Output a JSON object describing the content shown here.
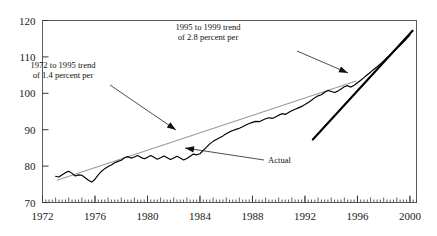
{
  "chart_data": {
    "type": "line",
    "title": "",
    "subtitle": "",
    "xlabel": "",
    "ylabel": "",
    "xlim": [
      1972,
      2000.5
    ],
    "ylim": [
      70,
      120
    ],
    "grid": false,
    "legend_position": "none",
    "y_ticks": [
      70,
      80,
      90,
      100,
      110,
      120
    ],
    "x_ticks": [
      1972,
      1976,
      1980,
      1984,
      1988,
      1992,
      1996,
      2000
    ],
    "x_minor_tick_interval": 0.25,
    "colors": {
      "actual_series": "#000000",
      "trend_1972_1995": "#9a9a9a",
      "trend_1995_1999": "#000000",
      "frame": "#5b5b5b",
      "text": "#111111"
    },
    "series": [
      {
        "name": "Actual",
        "style": "solid-black",
        "x": [
          1973.0,
          1973.25,
          1973.5,
          1973.75,
          1974.0,
          1974.25,
          1974.5,
          1974.75,
          1975.0,
          1975.25,
          1975.5,
          1975.75,
          1976.0,
          1976.25,
          1976.5,
          1976.75,
          1977.0,
          1977.25,
          1977.5,
          1977.75,
          1978.0,
          1978.25,
          1978.5,
          1978.75,
          1979.0,
          1979.25,
          1979.5,
          1979.75,
          1980.0,
          1980.25,
          1980.5,
          1980.75,
          1981.0,
          1981.25,
          1981.5,
          1981.75,
          1982.0,
          1982.25,
          1982.5,
          1982.75,
          1983.0,
          1983.25,
          1983.5,
          1983.75,
          1984.0,
          1984.25,
          1984.5,
          1984.75,
          1985.0,
          1985.25,
          1985.5,
          1985.75,
          1986.0,
          1986.25,
          1986.5,
          1986.75,
          1987.0,
          1987.25,
          1987.5,
          1987.75,
          1988.0,
          1988.25,
          1988.5,
          1988.75,
          1989.0,
          1989.25,
          1989.5,
          1989.75,
          1990.0,
          1990.25,
          1990.5,
          1990.75,
          1991.0,
          1991.25,
          1991.5,
          1991.75,
          1992.0,
          1992.25,
          1992.5,
          1992.75,
          1993.0,
          1993.25,
          1993.5,
          1993.75,
          1994.0,
          1994.25,
          1994.5,
          1994.75,
          1995.0,
          1995.25,
          1995.5,
          1995.75,
          1996.0,
          1996.25,
          1996.5,
          1996.75,
          1997.0,
          1997.25,
          1997.5,
          1997.75,
          1998.0,
          1998.25,
          1998.5,
          1998.75,
          1999.0,
          1999.25,
          1999.5,
          1999.75,
          2000.0
        ],
        "y": [
          77.2,
          77.0,
          77.6,
          78.2,
          78.6,
          78.0,
          77.3,
          77.6,
          77.5,
          76.8,
          76.1,
          75.6,
          76.4,
          77.6,
          78.6,
          79.3,
          79.9,
          80.3,
          80.9,
          81.3,
          81.6,
          82.3,
          82.6,
          82.2,
          82.5,
          82.9,
          82.4,
          82.0,
          82.4,
          82.9,
          82.4,
          81.9,
          82.3,
          82.8,
          82.3,
          81.8,
          82.2,
          82.7,
          82.2,
          81.7,
          82.1,
          82.7,
          83.3,
          83.1,
          83.4,
          84.3,
          85.2,
          86.1,
          86.8,
          87.3,
          87.8,
          88.3,
          88.9,
          89.4,
          89.8,
          90.1,
          90.4,
          90.8,
          91.3,
          91.7,
          92.0,
          92.3,
          92.2,
          92.6,
          93.0,
          93.3,
          93.1,
          93.5,
          94.0,
          94.4,
          94.2,
          94.7,
          95.2,
          95.6,
          96.0,
          96.4,
          96.9,
          97.5,
          98.1,
          98.8,
          99.3,
          99.6,
          100.3,
          100.8,
          100.5,
          100.2,
          100.6,
          101.2,
          101.8,
          102.1,
          101.7,
          102.2,
          102.9,
          103.6,
          104.3,
          105.1,
          105.8,
          106.6,
          107.3,
          108.1,
          108.9,
          109.8,
          110.6,
          111.5,
          112.3,
          113.2,
          114.1,
          115.0,
          116.0
        ]
      }
    ],
    "trend_lines": [
      {
        "name": "1972 to 1995 trend of 1.4 percent per year",
        "x_start": 1973.1,
        "y_start": 76.1,
        "x_end": 1995.9,
        "y_end": 103.4,
        "rate_percent": 1.4,
        "color": "#9a9a9a"
      },
      {
        "name": "1995 to 1999 trend of 2.8 percent per year",
        "x_start": 1992.6,
        "y_start": 87.3,
        "x_end": 2000.2,
        "y_end": 117.2,
        "rate_percent": 2.8,
        "color": "#000000"
      }
    ],
    "annotations": [
      {
        "id": "annotation-slow-trend",
        "line1": "1972 to 1995 trend",
        "line2": "of 1.4 percent per",
        "text_x": 63,
        "text_y": 68,
        "leader_from": [
          110,
          85
        ],
        "leader_to": [
          176,
          130
        ]
      },
      {
        "id": "annotation-fast-trend",
        "line1": "1995 to 1999 trend",
        "line2": "of 2.8 percent per",
        "text_x": 208,
        "text_y": 30,
        "leader_from": [
          297,
          51
        ],
        "leader_to": [
          348,
          73
        ]
      },
      {
        "id": "annotation-actual",
        "line1": "Actual",
        "line2": "",
        "text_x": 268,
        "text_y": 163,
        "leader_from": [
          264,
          160
        ],
        "leader_to": [
          185,
          148
        ]
      }
    ]
  },
  "axes": {
    "y_labels": [
      "120",
      "110",
      "100",
      "90",
      "80",
      "70"
    ],
    "x_labels": [
      "1972",
      "1976",
      "1980",
      "1984",
      "1988",
      "1992",
      "1996",
      "2000"
    ]
  },
  "annotations_text": {
    "slow_trend_line1": "1972 to 1995 trend",
    "slow_trend_line2": "of 1.4 percent per",
    "fast_trend_line1": "1995 to 1999 trend",
    "fast_trend_line2": "of 2.8 percent per",
    "actual_label": "Actual"
  }
}
